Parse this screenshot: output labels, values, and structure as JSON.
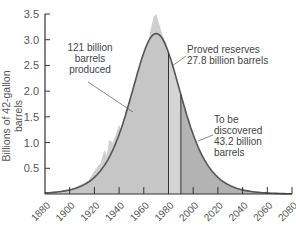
{
  "chart_data": {
    "type": "area",
    "title": "",
    "xlabel": "",
    "ylabel": "Billions of 42-gallon barrels",
    "xlim": [
      1880,
      2080
    ],
    "ylim": [
      0,
      3.5
    ],
    "x_ticks": [
      "1880",
      "1900",
      "1920",
      "1940",
      "1960",
      "1980",
      "2000",
      "2020",
      "2040",
      "2060",
      "2080"
    ],
    "y_ticks": [
      "0.5",
      "1.0",
      "1.5",
      "2.0",
      "2.5",
      "3.0",
      "3.5"
    ],
    "grid": false,
    "series": [
      {
        "name": "Hubbert curve (fitted)",
        "x": [
          1880,
          1900,
          1920,
          1940,
          1950,
          1960,
          1970,
          1980,
          1990,
          2000,
          2020,
          2040,
          2060,
          2080
        ],
        "values": [
          0.05,
          0.15,
          0.4,
          1.1,
          1.8,
          2.6,
          3.1,
          2.7,
          1.9,
          1.2,
          0.45,
          0.15,
          0.06,
          0.03
        ]
      },
      {
        "name": "Actual production",
        "x": [
          1900,
          1920,
          1930,
          1940,
          1950,
          1960,
          1965,
          1970
        ],
        "values": [
          0.1,
          0.5,
          0.9,
          1.3,
          2.0,
          2.6,
          3.0,
          3.5
        ]
      }
    ],
    "regions": [
      {
        "label": "121 billion barrels produced",
        "x_range": [
          1880,
          1980
        ]
      },
      {
        "label": "Proved reserves 27.8 billion barrels",
        "x_range": [
          1980,
          1990
        ]
      },
      {
        "label": "To be discovered 43.2 billion barrels",
        "x_range": [
          1990,
          2080
        ]
      }
    ],
    "annotations": [
      "121 billion barrels produced",
      "Proved reserves 27.8 billion barrels",
      "To be discovered 43.2 billion barrels"
    ]
  },
  "labels": {
    "ylabel": "Billions of 42-gallon barrels",
    "produced": [
      "121 billion",
      "barrels",
      "produced"
    ],
    "reserves": [
      "Proved reserves",
      "27.8 billion barrels"
    ],
    "discover": [
      "To be",
      "discovered",
      "43.2 billion",
      "barrels"
    ]
  }
}
